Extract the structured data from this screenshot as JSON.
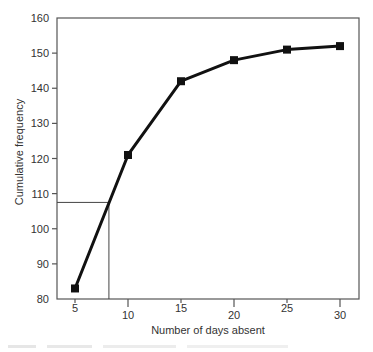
{
  "chart_data": {
    "type": "line",
    "title": "",
    "xlabel": "Number of days absent",
    "ylabel": "Cumulative frequency",
    "x": [
      5,
      10,
      15,
      20,
      25,
      30
    ],
    "series": [
      {
        "name": "Cumulative frequency",
        "values": [
          83,
          121,
          142,
          148,
          151,
          152
        ],
        "marker": "square",
        "color": "#111111"
      }
    ],
    "xlim": [
      3.3,
      32
    ],
    "ylim": [
      80,
      160
    ],
    "x_ticks": [
      5,
      10,
      15,
      20,
      25,
      30
    ],
    "y_ticks": [
      80,
      90,
      100,
      110,
      120,
      130,
      140,
      150,
      160
    ],
    "grid": false,
    "legend": "none",
    "annotations": [
      {
        "type": "reference_line",
        "description": "horizontal from y-axis at cumulative frequency ~107.5 meeting curve, then vertical drop to x-axis at ~8.2 days",
        "y": 107.5,
        "x": 8.2
      }
    ]
  },
  "labels": {
    "xlabel": "Number of days absent",
    "ylabel": "Cumulative frequency"
  }
}
